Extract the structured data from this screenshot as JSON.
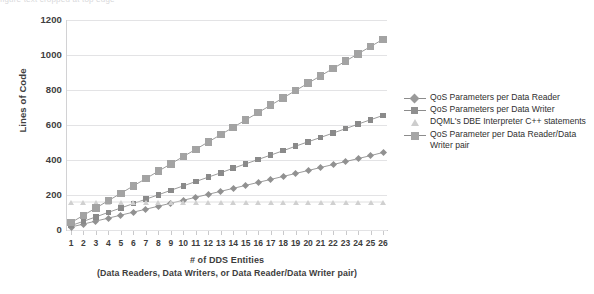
{
  "caption_remnant": "figure text cropped at top edge",
  "chart_data": {
    "type": "line",
    "title": "",
    "xlabel": "# of DDS Entities",
    "xlabel_sub": "(Data Readers, Data Writers, or Data Reader/Data Writer pair)",
    "ylabel": "Lines of Code",
    "ylim": [
      0,
      1200
    ],
    "ytick_labels": [
      "1200",
      "1000",
      "800",
      "600",
      "400",
      "200",
      "0"
    ],
    "ytick_values": [
      1200,
      1000,
      800,
      600,
      400,
      200,
      0
    ],
    "xlim": [
      1,
      26
    ],
    "grid": "horizontal",
    "legend_position": "right",
    "categories": [
      1,
      2,
      3,
      4,
      5,
      6,
      7,
      8,
      9,
      10,
      11,
      12,
      13,
      14,
      15,
      16,
      17,
      18,
      19,
      20,
      21,
      22,
      23,
      24,
      25,
      26
    ],
    "x": [
      1,
      2,
      3,
      4,
      5,
      6,
      7,
      8,
      9,
      10,
      11,
      12,
      13,
      14,
      15,
      16,
      17,
      18,
      19,
      20,
      21,
      22,
      23,
      24,
      25,
      26
    ],
    "series": [
      {
        "name": "QoS Parameters per Data Reader",
        "marker": "diamond",
        "color": "#919191",
        "values": [
          17,
          34,
          51,
          68,
          85,
          102,
          119,
          136,
          153,
          170,
          187,
          204,
          221,
          238,
          255,
          272,
          289,
          306,
          323,
          340,
          357,
          374,
          391,
          408,
          425,
          443
        ]
      },
      {
        "name": "QoS Parameters per Data Writer",
        "marker": "square-small",
        "color": "#8a8a8a",
        "values": [
          25,
          50,
          75,
          101,
          126,
          151,
          176,
          201,
          227,
          252,
          277,
          302,
          327,
          353,
          378,
          403,
          428,
          453,
          479,
          504,
          529,
          554,
          579,
          605,
          630,
          655
        ]
      },
      {
        "name": "DQML's DBE Interpreter C++ statements",
        "marker": "triangle",
        "color": "#d0d0d0",
        "values": [
          160,
          160,
          160,
          160,
          160,
          160,
          160,
          160,
          160,
          160,
          160,
          160,
          160,
          160,
          160,
          160,
          160,
          160,
          160,
          160,
          160,
          160,
          160,
          160,
          160,
          160
        ]
      },
      {
        "name": "QoS Parameter per Data Reader/Data Writer pair",
        "marker": "square-large",
        "color": "#a3a3a3",
        "values": [
          42,
          84,
          126,
          168,
          210,
          252,
          294,
          336,
          378,
          420,
          461,
          503,
          545,
          587,
          629,
          671,
          713,
          755,
          797,
          839,
          881,
          923,
          965,
          1007,
          1048,
          1090
        ]
      }
    ],
    "legend": [
      {
        "label": "QoS Parameters per Data Reader",
        "marker": "diamond"
      },
      {
        "label": "QoS Parameters per Data Writer",
        "marker": "square-small"
      },
      {
        "label": "DQML's DBE Interpreter C++ statements",
        "marker": "triangle"
      },
      {
        "label": "QoS Parameter per Data Reader/Data Writer pair",
        "marker": "square-large"
      }
    ]
  }
}
